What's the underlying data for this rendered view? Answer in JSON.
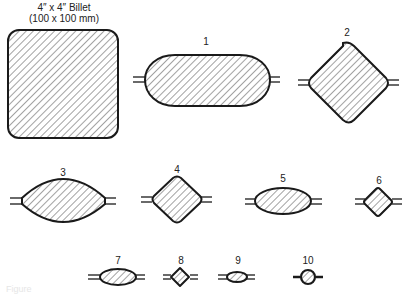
{
  "figure": {
    "billet": {
      "label_line1": "4″ x 4″ Billet",
      "label_line2": "(100 x 100 mm)",
      "shape": "rounded-square"
    },
    "passes": [
      {
        "number": "1",
        "shape": "oval"
      },
      {
        "number": "2",
        "shape": "diamond"
      },
      {
        "number": "3",
        "shape": "lens"
      },
      {
        "number": "4",
        "shape": "diamond"
      },
      {
        "number": "5",
        "shape": "oval"
      },
      {
        "number": "6",
        "shape": "diamond"
      },
      {
        "number": "7",
        "shape": "oval"
      },
      {
        "number": "8",
        "shape": "diamond"
      },
      {
        "number": "9",
        "shape": "oval"
      },
      {
        "number": "10",
        "shape": "round"
      }
    ],
    "caption": "Figure",
    "colors": {
      "outline": "#1a1a1a",
      "hatch": "#555555",
      "background": "#ffffff"
    }
  }
}
